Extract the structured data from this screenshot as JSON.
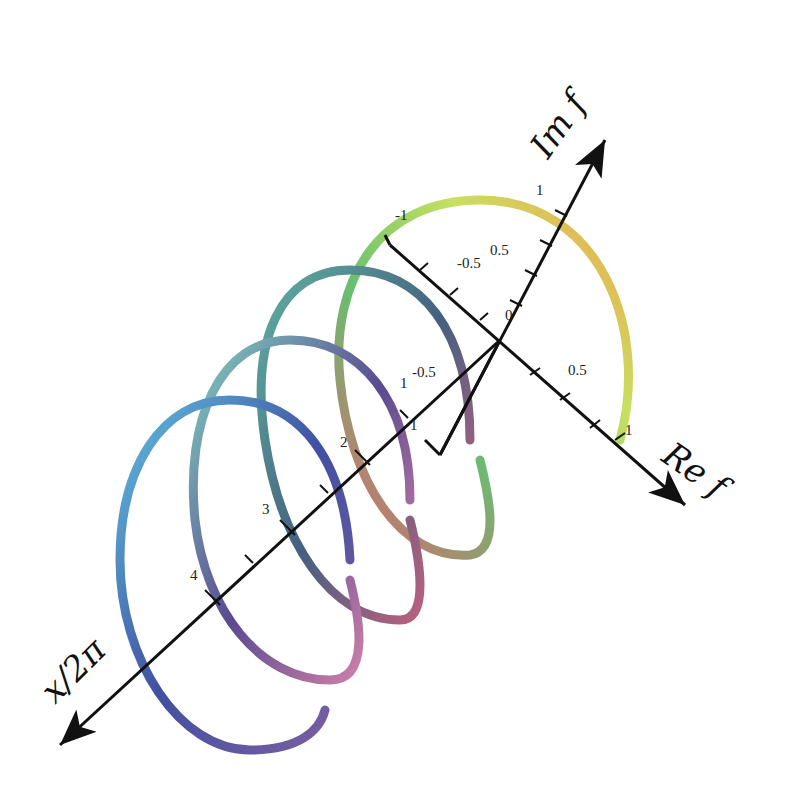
{
  "diagram": {
    "type": "3d-helix",
    "axes": {
      "x_axis_label": "x/2π",
      "re_axis_label": "Re f",
      "im_axis_label": "Im f"
    },
    "x_ticks": [
      "1",
      "2",
      "3",
      "4"
    ],
    "re_ticks": [
      "-1",
      "-0.5",
      "0",
      "0.5",
      "1"
    ],
    "im_ticks": [
      "-1",
      "-0.5",
      "0",
      "0.5",
      "1"
    ],
    "colors": {
      "axis": "#111111",
      "helix_start": "#f0a050",
      "helix_mid": "#6cc070",
      "helix_end": "#7a5aa0"
    }
  }
}
